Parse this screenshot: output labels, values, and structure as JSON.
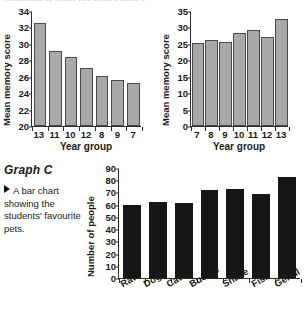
{
  "page": {
    "top_cut_heading": "(continued from previous page)"
  },
  "graph_c": {
    "heading": "Graph C",
    "caption": "A bar chart showing the students' favourite pets.",
    "bullet_icon": "triangle-right-icon"
  },
  "chart_data": [
    {
      "id": "chart-a",
      "type": "bar",
      "title": "",
      "xlabel": "Year group",
      "ylabel": "Mean memory score",
      "categories": [
        "13",
        "11",
        "10",
        "12",
        "8",
        "9",
        "7"
      ],
      "values": [
        32.5,
        29.1,
        28.4,
        27.1,
        26.1,
        25.6,
        25.2
      ],
      "ylim": [
        20,
        34
      ],
      "ytick_step": 2,
      "yticks": [
        "20",
        "22",
        "24",
        "26",
        "28",
        "30",
        "32",
        "34"
      ],
      "grid": false,
      "legend": "none",
      "bar_color": "#a9a9a9",
      "bar_edge_color": "#4a4a4a"
    },
    {
      "id": "chart-b",
      "type": "bar",
      "title": "",
      "xlabel": "Year group",
      "ylabel": "Mean memory score",
      "categories": [
        "7",
        "8",
        "9",
        "10",
        "11",
        "12",
        "13"
      ],
      "values": [
        25.2,
        26.1,
        25.6,
        28.4,
        29.1,
        27.1,
        32.5
      ],
      "ylim": [
        0,
        35
      ],
      "ytick_step": 5,
      "yticks": [
        "0",
        "5",
        "10",
        "15",
        "20",
        "25",
        "30",
        "35"
      ],
      "grid": false,
      "legend": "none",
      "bar_color": "#a9a9a9",
      "bar_edge_color": "#4a4a4a"
    },
    {
      "id": "chart-c",
      "type": "bar",
      "title": "Graph C",
      "xlabel": "",
      "ylabel": "Number of people",
      "categories": [
        "Rat",
        "Dog",
        "Cat",
        "Budgie",
        "Snake",
        "Fish",
        "Gerbil"
      ],
      "values": [
        60,
        62,
        61,
        72,
        73,
        69,
        83
      ],
      "ylim": [
        0,
        90
      ],
      "ytick_step": 10,
      "yticks": [
        "0",
        "10",
        "20",
        "30",
        "40",
        "50",
        "60",
        "70",
        "80",
        "90"
      ],
      "grid": false,
      "legend": "none",
      "bar_color": "#161616",
      "bar_edge_color": "#161616"
    }
  ]
}
